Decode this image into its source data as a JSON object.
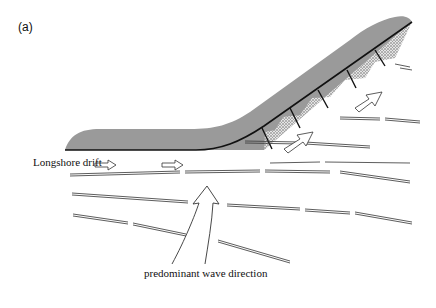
{
  "figure": {
    "panel_label": "(a)",
    "labels": {
      "longshore_drift": "Longshore drift",
      "wave_direction": "predominant wave direction"
    },
    "colors": {
      "land_fill": "#9a9a9a",
      "beach_stipple": "#b8b8b8",
      "shoreline": "#111111",
      "lines": "#333333"
    },
    "elements": {
      "groynes_count": 5,
      "drift_arrows_count": 2,
      "wave_arrows_oblique_count": 2
    }
  }
}
